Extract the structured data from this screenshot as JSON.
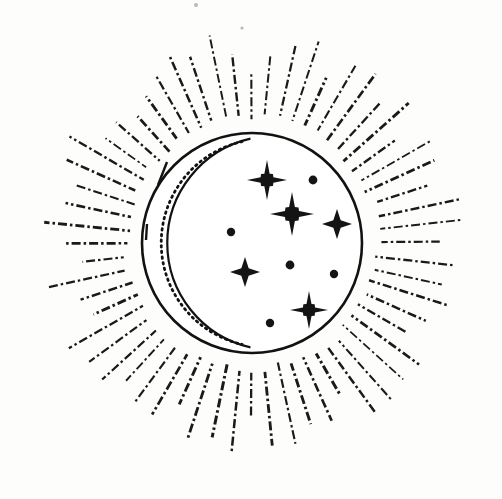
{
  "artwork": {
    "title": "Celestial Crescent Moon Sunburst",
    "style": "line-art",
    "background_color": "#fdfdfc",
    "ink_color": "#121212",
    "canvas": {
      "width": 502,
      "height": 499
    }
  },
  "disc": {
    "name": "moon-disc",
    "center_x": 252,
    "center_y": 243,
    "radius": 110,
    "stroke_width": 2.6
  },
  "crescent": {
    "name": "crescent-shadow",
    "arc_center_x": 274,
    "arc_center_y": 243,
    "arc_radius": 107,
    "stroke_width": 2.2,
    "dotted_center_x": 265,
    "dotted_center_y": 243,
    "dotted_radius": 104,
    "dot_dash": "1.5 4.2",
    "dot_width": 2.8
  },
  "edge_ticks": [
    {
      "name": "tick-upper-left",
      "x1": 158,
      "y1": 185,
      "x2": 167,
      "y2": 162
    },
    {
      "name": "tick-mid-left",
      "x1": 146,
      "y1": 240,
      "x2": 147,
      "y2": 224
    }
  ],
  "rays": {
    "count": 60,
    "inner_radius": 122,
    "outer_radius_min": 168,
    "outer_radius_max": 214,
    "dash_pattern": "9 3 2.5 3",
    "stroke_width_min": 1.7,
    "stroke_width_max": 3.0,
    "color": "#1a1a1a"
  },
  "stars": [
    {
      "name": "star-burst-upper",
      "type": "8-point",
      "cx": 267,
      "cy": 180,
      "size": 20
    },
    {
      "name": "star-burst-center",
      "type": "8-point",
      "cx": 292,
      "cy": 214,
      "size": 22
    },
    {
      "name": "star-burst-lower",
      "type": "8-point",
      "cx": 309,
      "cy": 310,
      "size": 19
    },
    {
      "name": "star-plus-right",
      "type": "4-point",
      "cx": 337,
      "cy": 224,
      "size": 15
    },
    {
      "name": "star-plus-left",
      "type": "4-point",
      "cx": 245,
      "cy": 272,
      "size": 15
    }
  ],
  "dots": [
    {
      "name": "dot-upper-right",
      "cx": 313,
      "cy": 180,
      "r": 4.4
    },
    {
      "name": "dot-left",
      "cx": 231,
      "cy": 232,
      "r": 4.2
    },
    {
      "name": "dot-center",
      "cx": 290,
      "cy": 265,
      "r": 4.4
    },
    {
      "name": "dot-right",
      "cx": 334,
      "cy": 274,
      "r": 4.2
    },
    {
      "name": "dot-lower-left",
      "cx": 270,
      "cy": 323,
      "r": 4.2
    }
  ],
  "specks": [
    {
      "name": "speck-top",
      "cx": 196,
      "cy": 5,
      "r": 2.0
    },
    {
      "name": "speck-top-right",
      "cx": 242,
      "cy": 28,
      "r": 1.6
    }
  ]
}
